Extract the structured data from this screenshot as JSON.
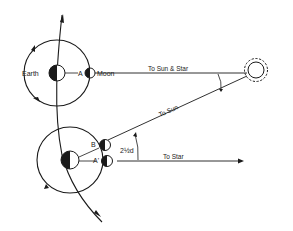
{
  "diagram": {
    "labels": {
      "earth": "Earth",
      "moon": "Moon",
      "point_a": "A",
      "point_b": "B",
      "point_a_prime": "A'",
      "to_sun_and_star": "To Sun & Star",
      "to_sun": "To Sun",
      "to_star": "To Star",
      "angle": "2½d"
    },
    "colors": {
      "ink": "#1a1a1a",
      "background": "#ffffff"
    }
  }
}
